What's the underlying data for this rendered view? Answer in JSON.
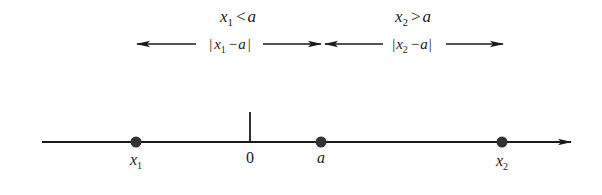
{
  "diagram": {
    "type": "number-line",
    "colors": {
      "ink": "#1a1a1a",
      "background": "#ffffff",
      "point": "#333333"
    },
    "conditions": [
      {
        "var": "x",
        "sub": "1",
        "op": "<",
        "rhs": "a"
      },
      {
        "var": "x",
        "sub": "2",
        "op": ">",
        "rhs": "a"
      }
    ],
    "distances": [
      {
        "label_open": "|",
        "var": "x",
        "sub": "1",
        "minus": "−",
        "rhs": "a",
        "label_close": "|"
      },
      {
        "label_open": "|",
        "var": "x",
        "sub": "2",
        "minus": "−",
        "rhs": "a",
        "label_close": "|"
      }
    ],
    "points": [
      {
        "name": "x1",
        "var": "x",
        "sub": "1",
        "pos": 136
      },
      {
        "name": "origin",
        "label": "0",
        "pos": 250
      },
      {
        "name": "a",
        "label": "a",
        "pos": 321
      },
      {
        "name": "x2",
        "var": "x",
        "sub": "2",
        "pos": 502
      }
    ]
  }
}
